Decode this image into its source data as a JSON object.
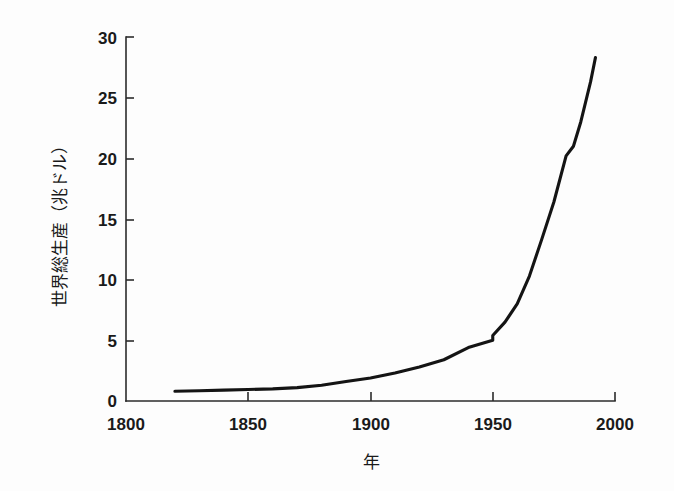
{
  "chart_data": {
    "type": "line",
    "title": "",
    "subtitle": "",
    "xlabel": "年",
    "ylabel": "世界総生産（兆ドル）",
    "xlim": [
      1800,
      2000
    ],
    "ylim": [
      0,
      30
    ],
    "xticks": [
      "1800",
      "1850",
      "1900",
      "1950",
      "2000"
    ],
    "yticks": [
      "0",
      "5",
      "10",
      "15",
      "20",
      "25",
      "30"
    ],
    "grid": false,
    "legend": "none",
    "series": [
      {
        "name": "世界総生産",
        "x": [
          1820,
          1830,
          1840,
          1850,
          1860,
          1870,
          1880,
          1890,
          1900,
          1910,
          1920,
          1930,
          1940,
          1950,
          1950,
          1955,
          1960,
          1965,
          1970,
          1975,
          1980,
          1983,
          1986,
          1990,
          1992
        ],
        "values": [
          0.8,
          0.85,
          0.9,
          0.95,
          1.0,
          1.1,
          1.3,
          1.6,
          1.9,
          2.3,
          2.8,
          3.4,
          4.4,
          5.0,
          5.4,
          6.5,
          8.0,
          10.3,
          13.3,
          16.4,
          20.2,
          21.0,
          23.0,
          26.3,
          28.3
        ]
      }
    ],
    "annotations": [
      {
        "label": "1950年の段差",
        "x": 1950,
        "y": 5.2
      }
    ]
  },
  "axes": {
    "x_axis_name": "year-axis",
    "y_axis_name": "world-gross-product-axis"
  }
}
